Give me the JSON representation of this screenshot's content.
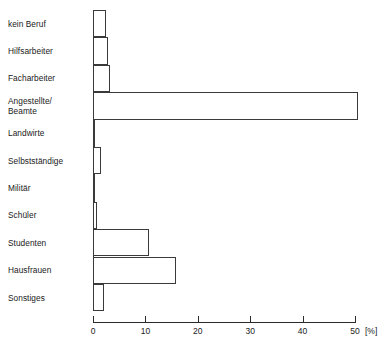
{
  "chart_data": {
    "type": "bar",
    "orientation": "horizontal",
    "title": "",
    "xlabel": "[%]",
    "ylabel": "",
    "xlim": [
      0,
      50
    ],
    "grid": false,
    "legend": null,
    "xticks": [
      0,
      10,
      20,
      30,
      40,
      50
    ],
    "xtick_labels": [
      "0",
      "10",
      "20",
      "30",
      "40",
      "50"
    ],
    "unit_label": "[%]",
    "categories": [
      "kein Beruf",
      "Hilfsarbeiter",
      "Facharbeiter",
      "Angestellte/\nBeamte",
      "Landwirte",
      "Selbstständige",
      "Militär",
      "Schüler",
      "Studenten",
      "Hausfrauen",
      "Sonstiges"
    ],
    "values": [
      2.5,
      2.9,
      3.2,
      50.5,
      0.3,
      1.5,
      0.4,
      0.8,
      10.7,
      15.8,
      2.1
    ]
  },
  "style": {
    "bar_fill": "#ffffff",
    "bar_stroke": "#3a3a3a",
    "axis_color": "#2b2b2b",
    "text_color": "#1a1a1a"
  }
}
